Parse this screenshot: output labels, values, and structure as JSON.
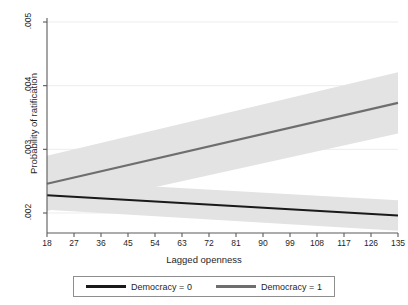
{
  "chart_data": {
    "type": "line",
    "title": "",
    "xlabel": "Lagged openness",
    "ylabel": "Probability of ratification",
    "xlim": [
      18,
      135
    ],
    "ylim": [
      0.0017,
      0.005
    ],
    "grid": true,
    "legend_position": "bottom",
    "x_ticks": [
      "18",
      "27",
      "36",
      "45",
      "54",
      "63",
      "72",
      "81",
      "90",
      "99",
      "108",
      "117",
      "126",
      "135"
    ],
    "x_tick_values": [
      18,
      27,
      36,
      45,
      54,
      63,
      72,
      81,
      90,
      99,
      108,
      117,
      126,
      135
    ],
    "y_ticks": [
      ".002",
      ".003",
      ".004",
      ".005"
    ],
    "y_tick_values": [
      0.002,
      0.003,
      0.004,
      0.005
    ],
    "x": [
      18,
      135
    ],
    "series": [
      {
        "name": "Democracy = 0",
        "color": "#1a1a1a",
        "values": [
          0.00228,
          0.00196
        ],
        "ci_lower": [
          0.00205,
          0.00172
        ],
        "ci_upper": [
          0.00251,
          0.0022
        ]
      },
      {
        "name": "Democracy = 1",
        "color": "#6e6e6e",
        "values": [
          0.00246,
          0.00373
        ],
        "ci_lower": [
          0.00203,
          0.00325
        ],
        "ci_upper": [
          0.0029,
          0.00421
        ]
      }
    ],
    "band_color": "#e3e3e3"
  },
  "legend": {
    "entries": [
      {
        "label": "Democracy = 0",
        "color": "#1a1a1a"
      },
      {
        "label": "Democracy = 1",
        "color": "#6e6e6e"
      }
    ]
  },
  "axes": {
    "y_title": "Probability of ratification",
    "x_title": "Lagged openness"
  }
}
